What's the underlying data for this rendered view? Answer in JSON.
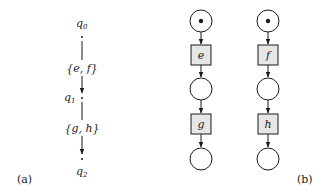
{
  "panel_a": {
    "caption": "(a)",
    "states": [
      {
        "name": "q",
        "sub": "0"
      },
      {
        "name": "q",
        "sub": "1"
      },
      {
        "name": "q",
        "sub": "2"
      }
    ],
    "edges": [
      {
        "label": "{e, f}"
      },
      {
        "label": "{g, h}"
      }
    ]
  },
  "panel_b": {
    "caption": "(b)",
    "columns": [
      {
        "transitions": [
          "e",
          "g"
        ]
      },
      {
        "transitions": [
          "f",
          "h"
        ]
      }
    ]
  },
  "colors": {
    "stroke": "#1a1a1a",
    "transition_fill": "#e6e6e6",
    "place_fill": "#ffffff"
  }
}
